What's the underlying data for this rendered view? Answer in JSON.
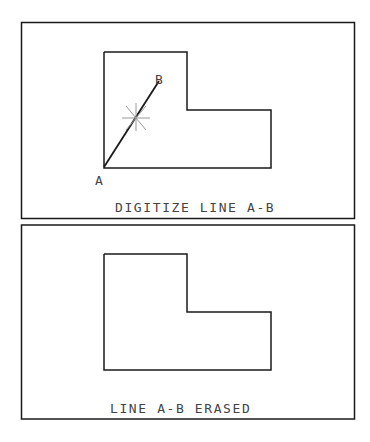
{
  "top_panel": {
    "point_a_label": "A",
    "point_b_label": "B",
    "caption": "DIGITIZE LINE A-B"
  },
  "bottom_panel": {
    "caption": "LINE A-B ERASED"
  },
  "icons": {
    "cursor": "crosshair-star-icon"
  },
  "colors": {
    "line": "#1a1a1a",
    "cursor": "#999999",
    "text": "#444444",
    "background": "#ffffff"
  }
}
